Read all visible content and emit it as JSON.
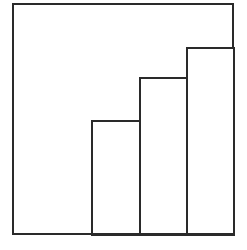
{
  "chart_data": {
    "type": "bar",
    "title": "",
    "subtitle": "",
    "xlabel": "",
    "ylabel": "",
    "categories": [
      "1",
      "2",
      "3"
    ],
    "values": [
      50,
      69,
      82
    ],
    "ylim": [
      0,
      100
    ],
    "xlim": [
      0,
      100
    ],
    "grid": false,
    "legend": null,
    "legend_position": "none",
    "tick_labels_x": [],
    "tick_labels_y": [],
    "annotations": []
  },
  "figure": {
    "name": "ascending-bar-chart",
    "canvas": {
      "width": 247,
      "height": 250,
      "background": "#ffffff"
    },
    "frame": {
      "name": "plot-frame",
      "x": 12,
      "y": 3,
      "width": 222,
      "height": 232,
      "stroke": "#2a2a2a",
      "stroke_width": 2,
      "fill": "none"
    },
    "baseline_y": 235,
    "bar_style": {
      "fill": "#ffffff",
      "stroke": "#2a2a2a",
      "stroke_width": 2
    },
    "bars": [
      {
        "name": "bar-1",
        "label": "1",
        "x": 92,
        "top_y": 121,
        "width": 48,
        "height": 114,
        "value": 50
      },
      {
        "name": "bar-2",
        "label": "2",
        "x": 140,
        "top_y": 78,
        "width": 47,
        "height": 157,
        "value": 69
      },
      {
        "name": "bar-3",
        "label": "3",
        "x": 187,
        "top_y": 48,
        "width": 47,
        "height": 187,
        "value": 82
      }
    ]
  },
  "colors": {
    "ink": "#2a2a2a",
    "paper": "#ffffff"
  }
}
